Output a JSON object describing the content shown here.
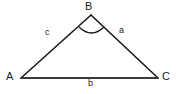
{
  "diagram": {
    "type": "triangle",
    "background_color": "#ffffff",
    "stroke_color": "#1a1a1a",
    "label_color": "#1a1a1a",
    "vertices": [
      {
        "id": "A",
        "label": "A",
        "x": 21,
        "y": 78,
        "label_x": 11,
        "label_y": 77
      },
      {
        "id": "B",
        "label": "B",
        "x": 91,
        "y": 15,
        "label_x": 90,
        "label_y": 6
      },
      {
        "id": "C",
        "label": "C",
        "x": 158,
        "y": 78,
        "label_x": 167,
        "label_y": 78
      }
    ],
    "sides": [
      {
        "id": "c",
        "label": "c",
        "from": "A",
        "to": "B",
        "label_x": 48,
        "label_y": 33
      },
      {
        "id": "a",
        "label": "a",
        "from": "B",
        "to": "C",
        "label_x": 122,
        "label_y": 31
      },
      {
        "id": "b",
        "label": "b",
        "from": "A",
        "to": "C",
        "label_x": 91,
        "label_y": 84
      }
    ],
    "angle_marks": [
      {
        "at": "B",
        "label": "",
        "arc_start_x": 79,
        "arc_start_y": 27,
        "arc_end_x": 104,
        "arc_end_y": 27,
        "arc_dip_y": 34
      }
    ]
  }
}
